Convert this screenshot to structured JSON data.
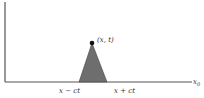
{
  "diagram": {
    "type": "domain-of-dependence",
    "point_label": "(x, t)",
    "left_base_label": "x − ct",
    "right_base_label": "x + ct",
    "x_axis_label_main": "x",
    "x_axis_label_sub": "0",
    "colors": {
      "axis": "#555555",
      "triangle_fill": "#6e6e6e",
      "point": "#111111",
      "text": "#333333"
    }
  }
}
